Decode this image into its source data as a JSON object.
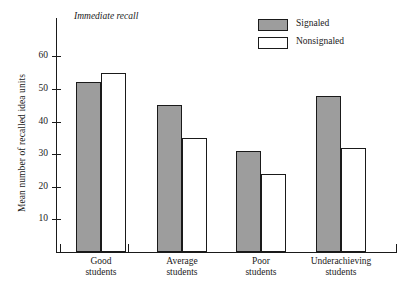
{
  "figure": {
    "top_cropped_remnant": "",
    "plot_title": "Immediate recall",
    "ylabel": "Mean number of recalled idea units"
  },
  "legend": {
    "position": "top-right",
    "items": [
      {
        "label": "Signaled",
        "swatch": "signaled-swatch",
        "color": "#9d9d9d"
      },
      {
        "label": "Nonsignaled",
        "swatch": "nonsignaled-swatch",
        "color": "#ffffff"
      }
    ]
  },
  "yaxis": {
    "ticks": [
      {
        "label": "60",
        "value": 60
      },
      {
        "label": "50",
        "value": 50
      },
      {
        "label": "40",
        "value": 40
      },
      {
        "label": "30",
        "value": 30
      },
      {
        "label": "20",
        "value": 20
      },
      {
        "label": "10",
        "value": 10
      }
    ]
  },
  "xaxis": {
    "groups": [
      {
        "line1": "Good",
        "line2": "students"
      },
      {
        "line1": "Average",
        "line2": "students"
      },
      {
        "line1": "Poor",
        "line2": "students"
      },
      {
        "line1": "Underachieving",
        "line2": "students"
      }
    ]
  },
  "chart_data": {
    "type": "bar",
    "title": "Immediate recall",
    "xlabel": "",
    "ylabel": "Mean number of recalled idea units",
    "categories": [
      "Good students",
      "Average students",
      "Poor students",
      "Underachieving students"
    ],
    "series": [
      {
        "name": "Signaled",
        "color": "#9d9d9d",
        "values": [
          52,
          45,
          31,
          48
        ]
      },
      {
        "name": "Nonsignaled",
        "color": "#ffffff",
        "values": [
          55,
          35,
          24,
          32
        ]
      }
    ],
    "ylim": [
      0,
      64
    ],
    "yticks": [
      10,
      20,
      30,
      40,
      50,
      60
    ],
    "grid": false,
    "legend_position": "top-right"
  }
}
